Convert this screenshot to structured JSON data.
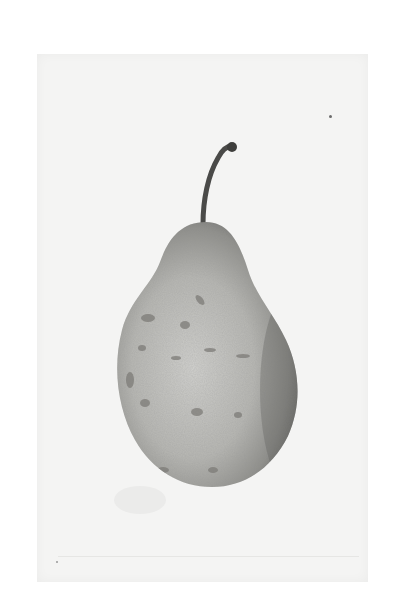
{
  "image": {
    "subject": "pear",
    "style": "monochrome botanical plate",
    "colors": {
      "background": "#ffffff",
      "paper": "#f4f4f3",
      "pear_light": "#c9c9c6",
      "pear_mid": "#a3a3a0",
      "pear_dark": "#6e6e6b",
      "stem": "#4a4a48",
      "blemish": "#7d7b77"
    }
  }
}
